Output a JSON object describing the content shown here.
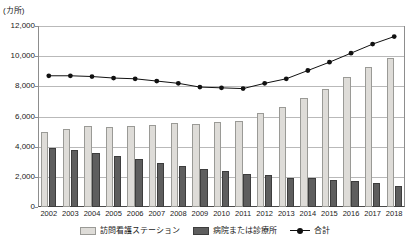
{
  "chart_data": {
    "type": "bar",
    "title": "",
    "xlabel": "",
    "ylabel": "",
    "unit_label": "(カ所)",
    "ylim": [
      0,
      12000
    ],
    "ytick_step": 2000,
    "grid": true,
    "legend_position": "bottom",
    "categories": [
      "2002",
      "2003",
      "2004",
      "2005",
      "2006",
      "2007",
      "2008",
      "2009",
      "2010",
      "2011",
      "2012",
      "2013",
      "2014",
      "2015",
      "2016",
      "2017",
      "2018"
    ],
    "ytick_labels": [
      "12,000",
      "10,000",
      "8,000",
      "6,000",
      "4,000",
      "2,000",
      "0"
    ],
    "ytick_values": [
      12000,
      10000,
      8000,
      6000,
      4000,
      2000,
      0
    ],
    "series": [
      {
        "name": "訪問看護ステーション",
        "kind": "bar",
        "color": "#dedcd8",
        "values": [
          5000,
          5150,
          5350,
          5300,
          5350,
          5450,
          5550,
          5500,
          5650,
          5700,
          6250,
          6600,
          7200,
          7800,
          8600,
          9300,
          9900
        ]
      },
      {
        "name": "病院または診療所",
        "kind": "bar",
        "color": "#5e5e5e",
        "values": [
          3900,
          3800,
          3550,
          3400,
          3200,
          2900,
          2700,
          2500,
          2400,
          2200,
          2100,
          1950,
          1900,
          1800,
          1700,
          1600,
          1400
        ]
      },
      {
        "name": "合計",
        "kind": "line",
        "color": "#111111",
        "values": [
          8700,
          8700,
          8650,
          8550,
          8500,
          8350,
          8200,
          7950,
          7900,
          7850,
          8200,
          8500,
          9050,
          9600,
          10200,
          10800,
          11300
        ]
      }
    ]
  },
  "legend": {
    "items": [
      {
        "label": "訪問看護ステーション",
        "swatch": "light"
      },
      {
        "label": "病院または診療所",
        "swatch": "dark"
      },
      {
        "label": "合計",
        "swatch": "line"
      }
    ]
  }
}
